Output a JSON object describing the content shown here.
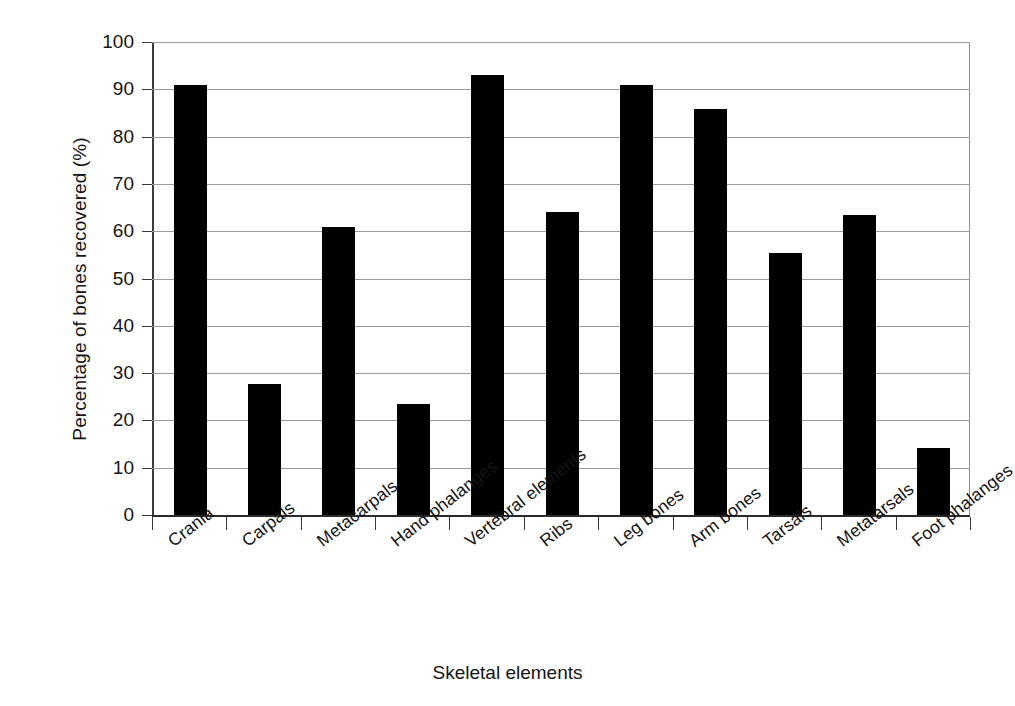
{
  "chart_data": {
    "type": "bar",
    "title": "",
    "xlabel": "Skeletal elements",
    "ylabel": "Percentage of bones recovered (%)",
    "categories": [
      "Crania",
      "Carpals",
      "Metacarpals",
      "Hand phalanges",
      "Vertebral elements",
      "Ribs",
      "Leg bones",
      "Arm bones",
      "Tarsals",
      "Metatarsals",
      "Foot phalanges"
    ],
    "values": [
      91,
      27.8,
      60.8,
      23.4,
      93,
      64,
      91,
      85.8,
      55.5,
      63.4,
      14.1
    ],
    "ylim": [
      0,
      100
    ],
    "y_ticks": [
      0,
      10,
      20,
      30,
      40,
      50,
      60,
      70,
      80,
      90,
      100
    ],
    "y_tick_labels": [
      "0",
      "10",
      "20",
      "30",
      "40",
      "50",
      "60",
      "70",
      "80",
      "90",
      "100"
    ],
    "grid": "horizontal",
    "legend": "none",
    "bar_color": "#000000",
    "grid_color": "#9a9a9a",
    "axis_color": "#3a3a3a",
    "background": "#ffffff"
  }
}
